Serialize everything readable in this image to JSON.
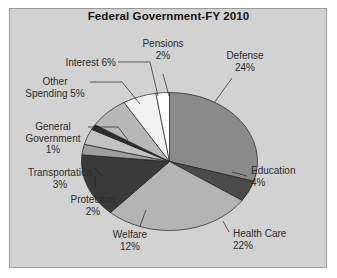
{
  "chart": {
    "title": "Federal Government-FY 2010",
    "panel_color": "#d2d2d2",
    "border_color": "#9a9a9a",
    "text_color": "#2b2b2b"
  },
  "labels": {
    "pensions": {
      "name": "Pensions",
      "pct": "2%"
    },
    "defense": {
      "name": "Defense",
      "pct": "24%"
    },
    "education": {
      "name": "Education",
      "pct": "4%"
    },
    "health": {
      "name": "Health Care",
      "pct": "22%"
    },
    "welfare": {
      "name": "Welfare",
      "pct": "12%"
    },
    "protection": {
      "name": "Protection",
      "pct": "2%"
    },
    "transport": {
      "name": "Transportation",
      "pct": "3%"
    },
    "general": {
      "name": "General",
      "name2": "Government",
      "pct": "1%"
    },
    "other": {
      "name": "Other",
      "name2": "Spending 5%"
    },
    "interest": {
      "name": "Interest 6%"
    }
  },
  "chart_data": {
    "type": "pie",
    "title": "Federal Government-FY 2010",
    "xlabel": "",
    "ylabel": "",
    "legend": "none",
    "grid": false,
    "units": "percent of total federal spending",
    "categories": [
      "Defense",
      "Education",
      "Health Care",
      "Welfare",
      "Protection",
      "Transportation",
      "General Government",
      "Interest",
      "Other Spending",
      "Pensions"
    ],
    "values": [
      24,
      4,
      22,
      12,
      2,
      3,
      1,
      6,
      5,
      2
    ],
    "colors": [
      "#8a8a8a",
      "#4a4a4a",
      "#b4b4b4",
      "#3a3a3a",
      "#9e9e9e",
      "#c2c2c2",
      "#2e2e2e",
      "#b8b8b8",
      "#f2f2f2",
      "#ffffff"
    ],
    "slices": [
      {
        "label": "Defense",
        "value": 24,
        "display": "Defense 24%",
        "color": "#8a8a8a"
      },
      {
        "label": "Education",
        "value": 4,
        "display": "Education 4%",
        "color": "#4a4a4a"
      },
      {
        "label": "Health Care",
        "value": 22,
        "display": "Health Care 22%",
        "color": "#b4b4b4"
      },
      {
        "label": "Welfare",
        "value": 12,
        "display": "Welfare 12%",
        "color": "#3a3a3a"
      },
      {
        "label": "Protection",
        "value": 2,
        "display": "Protection 2%",
        "color": "#9e9e9e"
      },
      {
        "label": "Transportation",
        "value": 3,
        "display": "Transportation 3%",
        "color": "#c2c2c2"
      },
      {
        "label": "General Government",
        "value": 1,
        "display": "General Government 1%",
        "color": "#2e2e2e"
      },
      {
        "label": "Interest",
        "value": 6,
        "display": "Interest 6%",
        "color": "#b8b8b8"
      },
      {
        "label": "Other Spending",
        "value": 5,
        "display": "Other Spending 5%",
        "color": "#f2f2f2"
      },
      {
        "label": "Pensions",
        "value": 2,
        "display": "Pensions 2%",
        "color": "#ffffff"
      }
    ],
    "start_angle_deg": 0,
    "direction": "clockwise",
    "total": 81
  }
}
